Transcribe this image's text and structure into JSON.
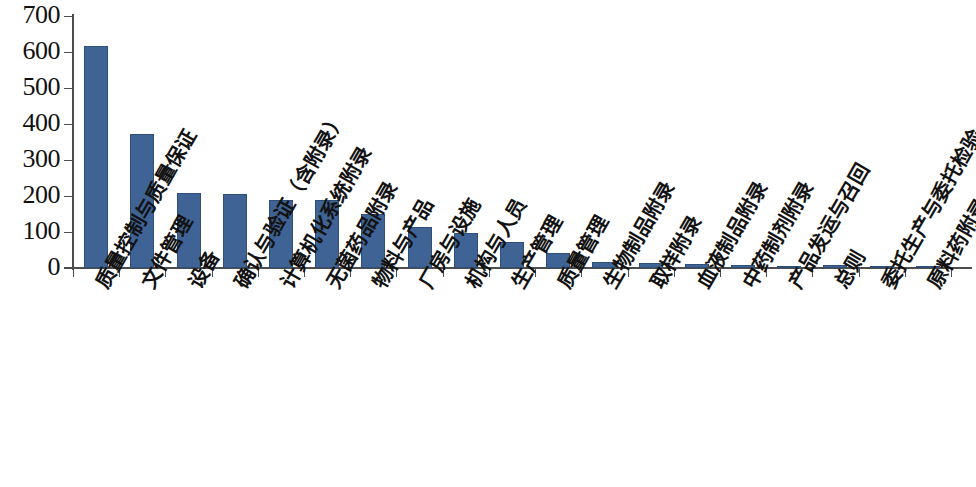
{
  "chart_data": {
    "type": "bar",
    "title": "",
    "subtitle": "",
    "xlabel": "",
    "ylabel": "",
    "ylim": [
      0,
      700
    ],
    "ytick_step": 100,
    "yticks": [
      0,
      100,
      200,
      300,
      400,
      500,
      600,
      700
    ],
    "grid": false,
    "legend": false,
    "legend_position": "none",
    "bar_color": "#3e6394",
    "bar_border_color": "#2f4f77",
    "axis_color": "#4d4d4d",
    "categories": [
      "质量控制与质量保证",
      "文件管理",
      "设备",
      "确认与验证（含附录）",
      "计算机化系统附录",
      "无菌药品附录",
      "物料与产品",
      "厂房与设施",
      "机构与人员",
      "生产管理",
      "质量管理",
      "生物制品附录",
      "取样附录",
      "血液制品附录",
      "中药制剂附录",
      "产品发运与召回",
      "总则",
      "委托生产与委托检验",
      "原料药附录"
    ],
    "values": [
      616,
      372,
      208,
      205,
      188,
      189,
      150,
      115,
      97,
      73,
      42,
      18,
      13,
      11,
      7,
      6,
      7,
      3,
      2
    ]
  }
}
